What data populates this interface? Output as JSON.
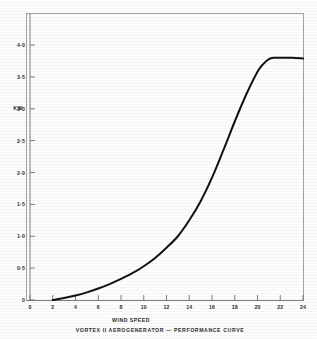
{
  "figure": {
    "caption": "VORTEX  II  AEROGENERATOR  —  PERFORMANCE  CURVE",
    "background_color": "#fdfdfd",
    "curve_color": "#111111",
    "axis_color": "#7d7d7d"
  },
  "chart_data": {
    "type": "line",
    "title": "VORTEX  II  AEROGENERATOR  —  PERFORMANCE  CURVE",
    "xlabel": "WIND SPEED",
    "ylabel": "KW",
    "xlim": [
      0,
      24
    ],
    "ylim": [
      0,
      4.2
    ],
    "grid": false,
    "legend": "none",
    "x_ticks": [
      0,
      2,
      4,
      6,
      8,
      10,
      12,
      14,
      16,
      18,
      20,
      22,
      24
    ],
    "x_tick_labels": [
      "0",
      "2",
      "4",
      "6",
      "8",
      "10",
      "12",
      "14",
      "16",
      "18",
      "20",
      "22",
      "24"
    ],
    "y_ticks": [
      0,
      0.5,
      1.0,
      1.5,
      2.0,
      2.5,
      3.0,
      3.5,
      4.0
    ],
    "y_tick_labels": [
      "0",
      "0·5",
      "1·0",
      "1·5",
      "2·0",
      "2·5",
      "3·0",
      "3·5",
      "4·0"
    ],
    "series": [
      {
        "name": "Power output",
        "x": [
          2,
          3,
          4,
          5,
          6,
          7,
          8,
          9,
          10,
          11,
          12,
          13,
          14,
          15,
          16,
          17,
          18,
          19,
          20,
          20.5,
          21,
          21.5,
          22,
          23,
          24
        ],
        "values": [
          0.0,
          0.03,
          0.07,
          0.12,
          0.18,
          0.25,
          0.33,
          0.42,
          0.53,
          0.66,
          0.82,
          1.0,
          1.25,
          1.55,
          1.92,
          2.35,
          2.8,
          3.22,
          3.58,
          3.7,
          3.78,
          3.8,
          3.8,
          3.8,
          3.79
        ]
      }
    ],
    "annotations": {
      "cut_in_speed": 2,
      "rated_power_kw": 3.8,
      "rated_speed": 21
    }
  },
  "axes": {
    "x_title": "WIND SPEED",
    "y_title": "KW"
  }
}
